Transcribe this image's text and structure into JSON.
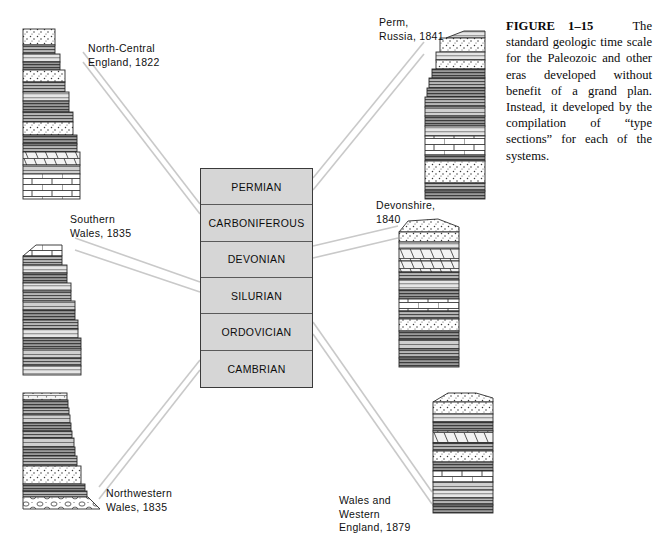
{
  "figure": {
    "caption_label": "FIGURE 1–15",
    "caption_body": "The standard geologic time scale for the Paleozoic and other eras developed without benefit of a grand plan. Instead, it developed by the compilation of “type sections” for each of the systems."
  },
  "time_scale": {
    "name": "geologic-time-scale",
    "fill_color": "#d6d6d6",
    "border_color": "#3a3a3a",
    "periods": [
      {
        "label": "PERMIAN"
      },
      {
        "label": "CARBONIFEROUS"
      },
      {
        "label": "DEVONIAN"
      },
      {
        "label": "SILURIAN"
      },
      {
        "label": "ORDOVICIAN"
      },
      {
        "label": "CAMBRIAN"
      }
    ]
  },
  "sections": [
    {
      "id": "north-central-england",
      "label": "North-Central\nEngland, 1822",
      "period": "CARBONIFEROUS"
    },
    {
      "id": "southern-wales",
      "label": "Southern\nWales, 1835",
      "period": "SILURIAN"
    },
    {
      "id": "northwestern-wales",
      "label": "Northwestern\nWales, 1835",
      "period": "CAMBRIAN"
    },
    {
      "id": "perm-russia",
      "label": "Perm,\nRussia, 1841",
      "period": "PERMIAN"
    },
    {
      "id": "devonshire",
      "label": "Devonshire,\n1840",
      "period": "DEVONIAN"
    },
    {
      "id": "wales-western-england",
      "label": "Wales and\nWestern\nEngland, 1879",
      "period": "ORDOVICIAN"
    }
  ],
  "icons": {
    "strat_column": "stratigraphic-column-icon",
    "connector": "connector-line-icon"
  }
}
